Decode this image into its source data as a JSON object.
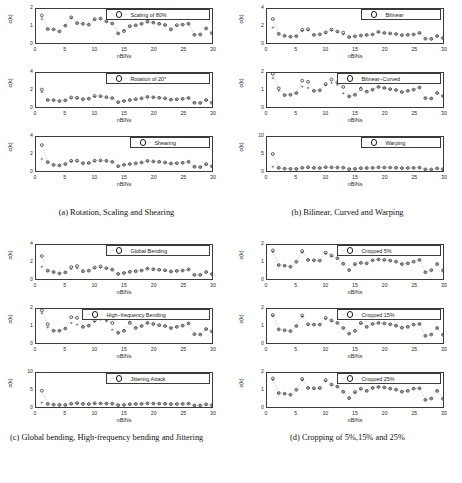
{
  "figure": {
    "axis_labels": {
      "x": "nBINs",
      "y": "c(k)"
    },
    "xticks": [
      0,
      5,
      10,
      15,
      20,
      25,
      30
    ],
    "xlim": [
      0,
      30
    ]
  },
  "subfigures": [
    {
      "id": "a",
      "caption": "(a) Rotation, Scaling and Shearing",
      "panels": [
        {
          "legend": "Scaling of 80%",
          "ylim": [
            0,
            2
          ],
          "yticks": [
            0,
            1,
            2
          ],
          "legend_left": 104,
          "legend_width": 104,
          "circles": [
            1.62,
            0.82,
            0.8,
            0.68,
            1.02,
            1.51,
            1.17,
            1.13,
            1.08,
            1.4,
            1.44,
            1.27,
            1.15,
            0.56,
            0.7,
            0.99,
            1.04,
            1.13,
            1.25,
            1.2,
            1.13,
            1.06,
            0.8,
            1.05,
            1.08,
            1.13,
            0.48,
            0.5,
            0.86,
            0.58
          ],
          "crosses": [
            1.4,
            0.82,
            0.8,
            0.68,
            1.02,
            1.48,
            1.17,
            1.13,
            1.08,
            1.38,
            1.42,
            1.27,
            1.15,
            0.56,
            0.75,
            0.99,
            1.04,
            1.13,
            1.25,
            1.2,
            1.13,
            1.06,
            0.8,
            1.02,
            1.08,
            1.13,
            0.48,
            0.5,
            0.86,
            0.58
          ]
        },
        {
          "legend": "Rotation of 20°",
          "ylim": [
            0,
            4
          ],
          "yticks": [
            0,
            2,
            4
          ],
          "legend_left": 104,
          "legend_width": 104,
          "circles": [
            2.05,
            0.82,
            0.8,
            0.7,
            0.78,
            1.12,
            1.08,
            0.92,
            0.98,
            1.3,
            1.28,
            1.15,
            1.05,
            0.56,
            0.7,
            0.82,
            0.92,
            1.02,
            1.18,
            1.14,
            1.08,
            1.02,
            0.86,
            0.9,
            0.96,
            1.06,
            0.5,
            0.48,
            0.82,
            0.5
          ],
          "crosses": [
            1.75,
            0.82,
            0.8,
            0.7,
            0.78,
            1.05,
            1.02,
            0.92,
            0.98,
            1.22,
            1.22,
            1.15,
            1.05,
            0.56,
            0.72,
            0.82,
            0.92,
            1.02,
            1.18,
            1.14,
            1.08,
            1.02,
            0.86,
            0.9,
            0.96,
            1.06,
            0.5,
            0.48,
            0.82,
            0.5
          ]
        },
        {
          "legend": "Shearing",
          "ylim": [
            0,
            4
          ],
          "yticks": [
            0,
            2,
            4
          ],
          "legend_left": 128,
          "legend_width": 80,
          "circles": [
            3.05,
            1.05,
            0.72,
            0.66,
            0.82,
            1.2,
            1.22,
            0.92,
            0.94,
            1.22,
            1.25,
            1.2,
            1.08,
            0.56,
            0.72,
            0.82,
            0.9,
            1.0,
            1.18,
            1.12,
            1.08,
            1.0,
            0.88,
            0.92,
            0.96,
            1.08,
            0.5,
            0.46,
            0.8,
            0.56
          ],
          "crosses": [
            1.42,
            1.02,
            0.72,
            0.66,
            0.82,
            1.12,
            1.14,
            0.92,
            0.94,
            1.15,
            1.18,
            1.18,
            1.06,
            0.56,
            0.74,
            0.82,
            0.9,
            1.0,
            1.18,
            1.12,
            1.08,
            1.0,
            0.88,
            0.92,
            0.96,
            1.08,
            0.5,
            0.46,
            0.8,
            0.56
          ]
        }
      ]
    },
    {
      "id": "b",
      "caption": "(b) Bilinear, Curved and Warping",
      "panels": [
        {
          "legend": "Bilinear",
          "ylim": [
            0,
            4
          ],
          "yticks": [
            0,
            2,
            4
          ],
          "legend_left": 128,
          "legend_width": 80,
          "circles": [
            2.82,
            1.08,
            0.84,
            0.74,
            0.8,
            1.55,
            1.62,
            0.95,
            1.02,
            1.25,
            1.58,
            1.35,
            1.22,
            0.7,
            0.78,
            0.88,
            0.95,
            1.0,
            1.3,
            1.18,
            1.12,
            1.05,
            0.92,
            0.96,
            1.0,
            1.18,
            0.5,
            0.48,
            0.82,
            0.58
          ],
          "crosses": [
            1.82,
            1.05,
            0.84,
            0.74,
            0.8,
            1.42,
            1.5,
            0.95,
            1.02,
            1.2,
            1.5,
            1.32,
            1.02,
            0.7,
            0.8,
            0.88,
            0.95,
            1.0,
            1.3,
            1.18,
            1.12,
            1.05,
            0.92,
            0.96,
            1.0,
            1.18,
            0.5,
            0.48,
            0.82,
            0.58
          ]
        },
        {
          "legend": "Bilinear−Curved",
          "ylim": [
            0,
            2
          ],
          "yticks": [
            0,
            1,
            2
          ],
          "legend_left": 104,
          "legend_width": 104,
          "circles": [
            1.95,
            1.1,
            0.7,
            0.72,
            0.82,
            1.55,
            1.48,
            0.95,
            0.98,
            1.35,
            1.62,
            1.45,
            1.18,
            0.62,
            0.72,
            1.05,
            0.9,
            1.02,
            1.18,
            1.12,
            1.05,
            1.0,
            0.88,
            0.95,
            1.02,
            1.15,
            0.52,
            0.5,
            0.82,
            0.65
          ],
          "crosses": [
            1.7,
            0.95,
            0.7,
            0.72,
            0.82,
            1.2,
            1.12,
            0.95,
            0.98,
            1.28,
            1.42,
            1.3,
            0.8,
            0.62,
            0.72,
            1.15,
            0.92,
            1.02,
            1.18,
            1.12,
            1.05,
            1.0,
            0.88,
            0.95,
            1.02,
            1.15,
            0.52,
            0.5,
            0.82,
            0.65
          ]
        },
        {
          "legend": "Warping",
          "ylim": [
            0,
            10
          ],
          "yticks": [
            0,
            5,
            10
          ],
          "legend_left": 128,
          "legend_width": 80,
          "circles": [
            5.0,
            0.92,
            0.7,
            0.62,
            0.6,
            0.95,
            1.1,
            0.92,
            0.88,
            1.12,
            1.08,
            1.02,
            1.0,
            0.55,
            0.62,
            0.82,
            0.88,
            0.92,
            1.08,
            1.02,
            1.0,
            0.95,
            0.85,
            0.88,
            0.92,
            1.0,
            0.48,
            0.45,
            0.78,
            0.55
          ],
          "crosses": [
            1.25,
            0.9,
            0.7,
            0.62,
            0.6,
            0.92,
            1.05,
            0.92,
            0.88,
            1.08,
            1.05,
            1.02,
            1.0,
            0.55,
            0.62,
            0.82,
            0.88,
            0.92,
            1.08,
            1.02,
            1.0,
            0.95,
            0.85,
            0.88,
            0.92,
            1.0,
            0.48,
            0.45,
            0.78,
            0.55
          ]
        }
      ]
    },
    {
      "id": "c",
      "caption": "(c) Global bending, High-frequency bending and Jittering",
      "panels": [
        {
          "legend": "Global Bending",
          "ylim": [
            0,
            4
          ],
          "yticks": [
            0,
            2,
            4
          ],
          "legend_left": 104,
          "legend_width": 104,
          "circles": [
            2.7,
            0.98,
            0.82,
            0.65,
            0.78,
            1.4,
            1.52,
            0.92,
            0.98,
            1.35,
            1.48,
            1.28,
            1.1,
            0.6,
            0.7,
            0.85,
            0.92,
            1.0,
            1.22,
            1.15,
            1.08,
            1.02,
            0.88,
            0.95,
            1.0,
            1.12,
            0.48,
            0.48,
            0.82,
            0.58
          ],
          "crosses": [
            1.45,
            0.95,
            0.82,
            0.65,
            0.78,
            1.18,
            1.25,
            0.92,
            0.98,
            1.28,
            1.35,
            1.25,
            1.1,
            0.6,
            0.72,
            0.85,
            0.92,
            1.0,
            1.22,
            1.15,
            1.08,
            1.02,
            0.88,
            0.95,
            1.0,
            1.12,
            0.48,
            0.48,
            0.82,
            0.58
          ]
        },
        {
          "legend": "High−frequency Bending",
          "ylim": [
            0,
            2
          ],
          "yticks": [
            0,
            1,
            2
          ],
          "legend_left": 80,
          "legend_width": 128,
          "circles": [
            1.92,
            1.1,
            0.72,
            0.72,
            0.85,
            1.52,
            1.48,
            0.95,
            1.02,
            1.32,
            1.58,
            1.4,
            1.18,
            0.6,
            0.72,
            1.18,
            0.88,
            1.0,
            1.18,
            1.12,
            1.05,
            1.0,
            0.88,
            0.95,
            1.02,
            1.15,
            0.52,
            0.5,
            0.82,
            0.68
          ],
          "crosses": [
            1.75,
            0.92,
            0.72,
            0.72,
            0.85,
            1.18,
            1.08,
            0.95,
            1.02,
            1.25,
            1.38,
            1.28,
            0.78,
            0.6,
            0.72,
            1.25,
            0.9,
            1.0,
            1.18,
            1.12,
            1.05,
            1.0,
            0.88,
            0.95,
            1.02,
            1.15,
            0.52,
            0.5,
            0.82,
            0.68
          ]
        },
        {
          "legend": "Jittering Attack",
          "ylim": [
            0,
            10
          ],
          "yticks": [
            0,
            5,
            10
          ],
          "legend_left": 104,
          "legend_width": 104,
          "circles": [
            4.8,
            0.92,
            0.7,
            0.62,
            0.6,
            0.95,
            1.15,
            0.92,
            0.88,
            1.1,
            1.05,
            1.02,
            0.98,
            0.55,
            0.62,
            0.82,
            0.88,
            0.92,
            1.08,
            1.02,
            1.0,
            0.95,
            0.85,
            0.88,
            0.92,
            1.0,
            0.48,
            0.45,
            0.78,
            0.55
          ],
          "crosses": [
            1.28,
            0.9,
            0.7,
            0.62,
            0.6,
            0.92,
            1.08,
            0.92,
            0.88,
            1.05,
            1.02,
            1.02,
            0.98,
            0.55,
            0.62,
            0.82,
            0.88,
            0.92,
            1.08,
            1.02,
            1.0,
            0.95,
            0.85,
            0.88,
            0.92,
            1.0,
            0.48,
            0.45,
            0.78,
            0.55
          ]
        }
      ]
    },
    {
      "id": "d",
      "caption": "(d) Cropping of 5%,15% and 25%",
      "panels": [
        {
          "legend": "Cropped 5%",
          "ylim": [
            0,
            2
          ],
          "yticks": [
            0,
            1,
            2
          ],
          "legend_left": 104,
          "legend_width": 104,
          "circles": [
            1.68,
            0.82,
            0.78,
            0.72,
            1.02,
            1.65,
            1.12,
            1.1,
            1.08,
            1.55,
            1.38,
            1.22,
            0.9,
            0.52,
            0.88,
            0.95,
            0.92,
            1.1,
            1.15,
            1.12,
            1.08,
            1.02,
            0.88,
            0.92,
            1.02,
            1.12,
            0.4,
            0.52,
            0.88,
            0.5
          ],
          "crosses": [
            1.6,
            0.82,
            0.78,
            0.72,
            1.0,
            1.55,
            1.12,
            1.1,
            1.08,
            1.5,
            1.35,
            1.22,
            0.9,
            0.52,
            0.85,
            0.95,
            0.92,
            1.1,
            1.15,
            1.12,
            1.08,
            1.02,
            0.88,
            0.92,
            1.02,
            1.12,
            0.4,
            0.52,
            0.88,
            0.5
          ]
        },
        {
          "legend": "Cropped 15%",
          "ylim": [
            0,
            2
          ],
          "yticks": [
            0,
            1,
            2
          ],
          "legend_left": 104,
          "legend_width": 104,
          "circles": [
            1.65,
            0.8,
            0.75,
            0.7,
            1.0,
            1.62,
            1.1,
            1.08,
            1.08,
            1.48,
            1.32,
            1.18,
            0.88,
            0.55,
            0.72,
            1.18,
            0.95,
            1.12,
            1.18,
            1.15,
            1.1,
            1.02,
            0.9,
            0.95,
            1.08,
            1.12,
            0.42,
            0.5,
            0.88,
            0.48
          ],
          "crosses": [
            1.58,
            0.8,
            0.75,
            0.7,
            1.0,
            1.55,
            1.1,
            1.08,
            1.08,
            1.42,
            1.3,
            1.18,
            0.88,
            0.55,
            0.7,
            1.15,
            0.95,
            1.12,
            1.18,
            1.15,
            1.1,
            1.02,
            0.9,
            0.95,
            1.08,
            1.12,
            0.42,
            0.5,
            0.88,
            0.48
          ]
        },
        {
          "legend": "Cropped 25%",
          "ylim": [
            0,
            2
          ],
          "yticks": [
            0,
            1,
            2
          ],
          "legend_left": 104,
          "legend_width": 104,
          "circles": [
            1.68,
            0.82,
            0.78,
            0.72,
            1.02,
            1.65,
            1.12,
            1.1,
            1.12,
            1.58,
            1.32,
            1.2,
            0.9,
            0.52,
            0.88,
            1.08,
            0.95,
            1.12,
            1.18,
            1.15,
            1.08,
            1.02,
            0.9,
            0.95,
            1.08,
            1.1,
            0.42,
            0.5,
            0.95,
            0.48
          ],
          "crosses": [
            1.6,
            0.82,
            0.78,
            0.72,
            1.0,
            1.58,
            1.12,
            1.1,
            1.1,
            1.52,
            1.3,
            1.2,
            0.9,
            0.52,
            0.85,
            1.05,
            0.95,
            1.12,
            1.18,
            1.15,
            1.08,
            1.02,
            0.9,
            0.95,
            1.08,
            1.1,
            0.42,
            0.5,
            0.95,
            0.48
          ]
        }
      ]
    }
  ],
  "chart_data": {
    "type": "scatter",
    "xlabel": "nBINs",
    "ylabel": "c(k)",
    "x": [
      1,
      2,
      3,
      4,
      5,
      6,
      7,
      8,
      9,
      10,
      11,
      12,
      13,
      14,
      15,
      16,
      17,
      18,
      19,
      20,
      21,
      22,
      23,
      24,
      25,
      26,
      27,
      28,
      29,
      30
    ],
    "xlim": [
      0,
      30
    ],
    "xticks": [
      0,
      5,
      10,
      15,
      20,
      25,
      30
    ],
    "grid": false,
    "legend_position": "top-right",
    "markers": [
      "circle",
      "plus"
    ],
    "line_style": "dotted",
    "panels": [
      {
        "title": "Scaling of 80%",
        "ylim": [
          0,
          2
        ]
      },
      {
        "title": "Rotation of 20°",
        "ylim": [
          0,
          4
        ]
      },
      {
        "title": "Shearing",
        "ylim": [
          0,
          4
        ]
      },
      {
        "title": "Bilinear",
        "ylim": [
          0,
          4
        ]
      },
      {
        "title": "Bilinear−Curved",
        "ylim": [
          0,
          2
        ]
      },
      {
        "title": "Warping",
        "ylim": [
          0,
          10
        ]
      },
      {
        "title": "Global Bending",
        "ylim": [
          0,
          4
        ]
      },
      {
        "title": "High−frequency Bending",
        "ylim": [
          0,
          2
        ]
      },
      {
        "title": "Jittering Attack",
        "ylim": [
          0,
          10
        ]
      },
      {
        "title": "Cropped 5%",
        "ylim": [
          0,
          2
        ]
      },
      {
        "title": "Cropped 15%",
        "ylim": [
          0,
          2
        ]
      },
      {
        "title": "Cropped 25%",
        "ylim": [
          0,
          2
        ]
      }
    ]
  }
}
